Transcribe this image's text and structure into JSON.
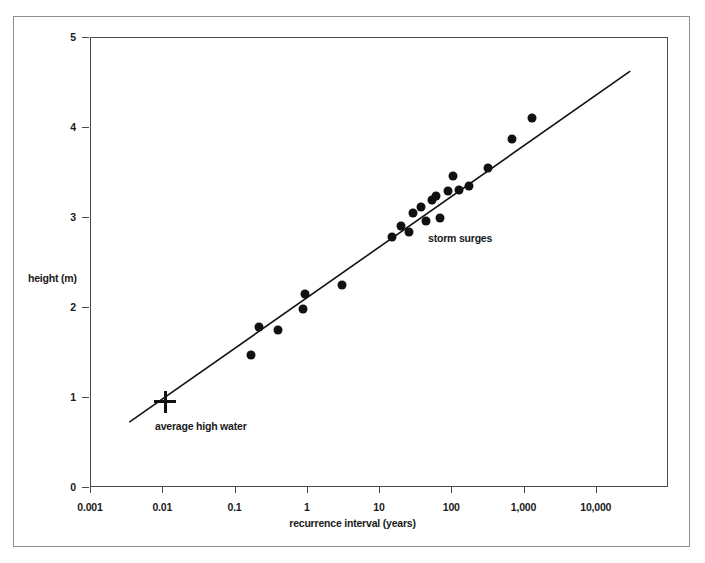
{
  "chart_data": {
    "type": "scatter",
    "title": "",
    "xlabel": "recurrence interval (years)",
    "ylabel": "height (m)",
    "xscale": "log",
    "yscale": "linear",
    "xlim": [
      0.001,
      100000
    ],
    "ylim": [
      0,
      5
    ],
    "grid": false,
    "legend": "none",
    "x_ticks": [
      {
        "value": 0.001,
        "label": "0.001"
      },
      {
        "value": 0.01,
        "label": "0.01"
      },
      {
        "value": 0.1,
        "label": "0.1"
      },
      {
        "value": 1,
        "label": "1"
      },
      {
        "value": 10,
        "label": "10"
      },
      {
        "value": 100,
        "label": "100"
      },
      {
        "value": 1000,
        "label": "1,000"
      },
      {
        "value": 10000,
        "label": "10,000"
      }
    ],
    "y_ticks": [
      {
        "value": 0,
        "label": "0"
      },
      {
        "value": 1,
        "label": "1"
      },
      {
        "value": 2,
        "label": "2"
      },
      {
        "value": 3,
        "label": "3"
      },
      {
        "value": 4,
        "label": "4"
      },
      {
        "value": 5,
        "label": "5"
      }
    ],
    "series": [
      {
        "name": "storm surges",
        "marker": "filled-circle",
        "color": "#111111",
        "points": [
          {
            "x": 0.17,
            "y": 1.47
          },
          {
            "x": 0.22,
            "y": 1.78
          },
          {
            "x": 0.4,
            "y": 1.75
          },
          {
            "x": 0.9,
            "y": 1.98
          },
          {
            "x": 0.95,
            "y": 2.15
          },
          {
            "x": 3.1,
            "y": 2.24
          },
          {
            "x": 15.0,
            "y": 2.78
          },
          {
            "x": 20.0,
            "y": 2.9
          },
          {
            "x": 26.0,
            "y": 2.83
          },
          {
            "x": 30.0,
            "y": 3.05
          },
          {
            "x": 38.0,
            "y": 3.11
          },
          {
            "x": 45.0,
            "y": 2.96
          },
          {
            "x": 55.0,
            "y": 3.19
          },
          {
            "x": 62.0,
            "y": 3.23
          },
          {
            "x": 70.0,
            "y": 2.99
          },
          {
            "x": 90.0,
            "y": 3.29
          },
          {
            "x": 105.0,
            "y": 3.46
          },
          {
            "x": 130.0,
            "y": 3.3
          },
          {
            "x": 175.0,
            "y": 3.35
          },
          {
            "x": 320.0,
            "y": 3.55
          },
          {
            "x": 700.0,
            "y": 3.87
          },
          {
            "x": 1300.0,
            "y": 4.1
          }
        ]
      },
      {
        "name": "average high water",
        "marker": "plus-cross",
        "color": "#111111",
        "points": [
          {
            "x": 0.011,
            "y": 0.95
          }
        ]
      }
    ],
    "fit_line": {
      "name": "regression line",
      "color": "#111111",
      "start": {
        "x": 0.0035,
        "y": 0.72
      },
      "end": {
        "x": 30000,
        "y": 4.62
      }
    },
    "annotations": [
      {
        "name": "storm-surges",
        "text": "storm surges"
      },
      {
        "name": "average-high-water",
        "text": "average high water"
      }
    ]
  },
  "annotation_text": {
    "storm_surges": "storm surges",
    "average_high_water": "average high water"
  },
  "colors": {
    "marker": "#111111",
    "axis": "#4a4a4a",
    "outer_border": "#8e8e8e",
    "background": "#ffffff",
    "text": "#1a1a1a"
  }
}
